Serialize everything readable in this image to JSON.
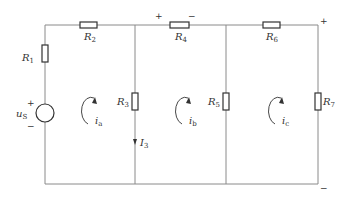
{
  "diagram": {
    "type": "circuit",
    "title": "",
    "resistors": [
      {
        "id": "R1",
        "label": "R",
        "sub": "1",
        "orientation": "vertical"
      },
      {
        "id": "R2",
        "label": "R",
        "sub": "2",
        "orientation": "horizontal"
      },
      {
        "id": "R3",
        "label": "R",
        "sub": "3",
        "orientation": "vertical"
      },
      {
        "id": "R4",
        "label": "R",
        "sub": "4",
        "orientation": "horizontal"
      },
      {
        "id": "R5",
        "label": "R",
        "sub": "5",
        "orientation": "vertical"
      },
      {
        "id": "R6",
        "label": "R",
        "sub": "6",
        "orientation": "horizontal"
      },
      {
        "id": "R7",
        "label": "R",
        "sub": "7",
        "orientation": "vertical"
      }
    ],
    "source": {
      "label": "u",
      "sub": "S",
      "plus": "+",
      "minus": "−"
    },
    "mesh_currents": [
      {
        "label": "i",
        "sub": "a",
        "direction": "clockwise"
      },
      {
        "label": "i",
        "sub": "b",
        "direction": "clockwise"
      },
      {
        "label": "i",
        "sub": "c",
        "direction": "clockwise"
      }
    ],
    "branch_current": {
      "label": "I",
      "sub": "3",
      "direction": "down"
    },
    "r4_polarity": {
      "plus": "+",
      "minus": "−"
    },
    "output_polarity": {
      "plus": "+",
      "minus": "−"
    }
  }
}
